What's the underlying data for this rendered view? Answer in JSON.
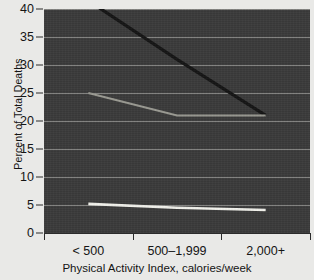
{
  "chart_data": {
    "type": "line",
    "title": "",
    "subtitle": "",
    "xlabel": "Physical Activity Index, calories/week",
    "ylabel": "Percent of Total Deaths",
    "categories": [
      "< 500",
      "500–1,999",
      "2,000+"
    ],
    "ylim": [
      0,
      40
    ],
    "yticks": [
      0,
      5,
      10,
      15,
      20,
      25,
      30,
      35,
      40
    ],
    "ytick_labels": [
      "0",
      "5",
      "10",
      "15",
      "20",
      "25",
      "30",
      "35",
      "40"
    ],
    "grid": true,
    "grid_axis": "y",
    "legend": "none",
    "plot_background": "#3a3a3a",
    "page_background": "#e9e9e7",
    "series": [
      {
        "name": "series-dark",
        "color": "#141414",
        "width": 3.2,
        "values": [
          41.5,
          31.0,
          21.0
        ]
      },
      {
        "name": "series-gray",
        "color": "#9a9a92",
        "width": 2.0,
        "values": [
          25.0,
          21.0,
          21.0
        ]
      },
      {
        "name": "series-white",
        "color": "#f2f2ec",
        "width": 2.6,
        "values": [
          5.2,
          4.5,
          4.1
        ]
      }
    ]
  }
}
